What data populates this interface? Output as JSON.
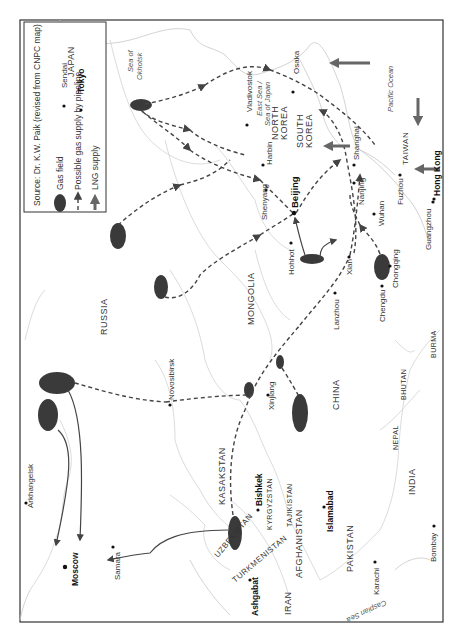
{
  "legend": {
    "source": "Source: Dr. K.W. Paik (revised from CNPC map)",
    "items": [
      {
        "icon": "gas-field-ellipse",
        "label": "Gas field"
      },
      {
        "icon": "dashed-arrow",
        "label": "Possible gas supply by pipeline"
      },
      {
        "icon": "solid-arrow",
        "label": "LNG supply"
      }
    ]
  },
  "countries": {
    "russia": "RUSSIA",
    "mongolia": "MONGOLIA",
    "china": "CHINA",
    "kasakstan": "KASAKSTAN",
    "uzbekistan": "UZBEKISTAN",
    "turkmenistan": "TURKMENISTAN",
    "kyrgyzstan": "KYRGYZSTAN",
    "tajikistan": "TAJIKISTAN",
    "afghanistan": "AFGHANISTAN",
    "iran": "IRAN",
    "pakistan": "PAKISTAN",
    "india": "INDIA",
    "nepal": "NEPAL",
    "bhutan": "BHUTAN",
    "burma": "BURMA",
    "north_korea_1": "NORTH",
    "north_korea_2": "KOREA",
    "south_korea_1": "SOUTH",
    "south_korea_2": "KOREA",
    "japan": "JAPAN",
    "taiwan": "TAIWAN"
  },
  "seas": {
    "okhotsk_1": "Sea of",
    "okhotsk_2": "Okhotsk",
    "east_sea_1": "East Sea /",
    "east_sea_2": "Sea of Japan",
    "pacific": "Pacific Ocean",
    "caspian": "Caspian Sea"
  },
  "cities": {
    "moscow": "Moscow",
    "arkhangelsk": "Arkhangelsk",
    "samara": "Samara",
    "novosibirsk": "Novosibirsk",
    "bishkek": "Bishkek",
    "ashgabat": "Ashgabat",
    "islamabad": "Islamabad",
    "karachi": "Karachi",
    "bombay": "Bombay",
    "xinjiang": "Xinjiang",
    "lanzhou": "Lanzhou",
    "chengdu": "Chengdu",
    "chongqing": "Chongqing",
    "xian": "Xian",
    "hohhot": "Hohhot",
    "beijing": "Beijing",
    "wuhan": "Wuhan",
    "nanjing": "Nanjing",
    "shanghai": "Shanghai",
    "fuzhou": "Fuzhou",
    "guangzhou": "Guangzhou",
    "hong_kong": "Hong Kong",
    "harbin": "Harbin",
    "shenyang": "Shenyang",
    "vladivostok": "Vladivostok",
    "sendai": "Sendai",
    "tokyo": "Tokyo",
    "osaka": "Osaka"
  },
  "colors": {
    "gas_field": "#3a3a3a",
    "pipeline": "#444444",
    "lng_arrow": "#666666",
    "border": "#d2d2d2",
    "frame": "#333333"
  }
}
